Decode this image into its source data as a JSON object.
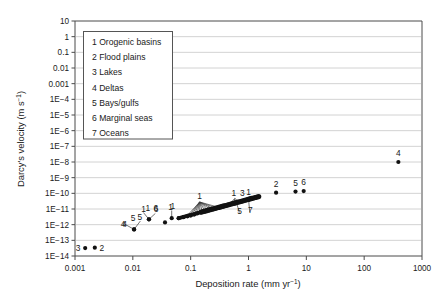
{
  "chart_data": {
    "type": "scatter",
    "title": "",
    "xlabel": "Deposition rate (mm yr^-1)",
    "xlabel_main": "Deposition rate (mm yr",
    "xlabel_sup": "-1",
    "xlabel_tail": ")",
    "ylabel": "Darcy's velocity (m s^-1)",
    "ylabel_main": "Darcy's velocity (m s",
    "ylabel_sup": "-1",
    "ylabel_tail": ")",
    "xscale": "log",
    "yscale": "log",
    "xlim": [
      0.001,
      1000
    ],
    "ylim": [
      1e-14,
      10
    ],
    "grid": "horizontal",
    "legend_position": "upper-left-inside",
    "xticks": [
      "0.001",
      "0.01",
      "0.1",
      "1",
      "10",
      "100",
      "1000"
    ],
    "xtick_values": [
      0.001,
      0.01,
      0.1,
      1,
      10,
      100,
      1000
    ],
    "yticks": [
      "10",
      "1",
      "0.1",
      "0.01",
      "0.001",
      "1E-4",
      "1E-5",
      "1E-6",
      "1E-7",
      "1E-8",
      "1E-9",
      "1E-10",
      "1E-11",
      "1E-12",
      "1E-13",
      "1E-14"
    ],
    "ytick_values": [
      10,
      1,
      0.1,
      0.01,
      0.001,
      0.0001,
      1e-05,
      1e-06,
      1e-07,
      1e-08,
      1e-09,
      1e-10,
      1e-11,
      1e-12,
      1e-13,
      1e-14
    ],
    "legend": [
      {
        "key": "1",
        "label": "1 Orogenic basins"
      },
      {
        "key": "2",
        "label": "2 Flood plains"
      },
      {
        "key": "3",
        "label": "3 Lakes"
      },
      {
        "key": "4",
        "label": "4 Deltas"
      },
      {
        "key": "5",
        "label": "5 Bays/gulfs"
      },
      {
        "key": "6",
        "label": "6 Marginal seas"
      },
      {
        "key": "7",
        "label": "7 Oceans"
      }
    ],
    "points": [
      {
        "x": 0.0015,
        "y": 3.2e-14,
        "label": "3",
        "label_side": "left"
      },
      {
        "x": 0.0022,
        "y": 3.4e-14,
        "label": "2",
        "label_side": "right"
      },
      {
        "x": 0.0105,
        "y": 5e-13,
        "label": "4",
        "label_side": "leader-left"
      },
      {
        "x": 0.0105,
        "y": 5e-13,
        "label": "5",
        "label_side": "leader-up"
      },
      {
        "x": 0.019,
        "y": 2.2e-12,
        "label": "1",
        "label_side": "leader-up"
      },
      {
        "x": 0.019,
        "y": 2.2e-12,
        "label": "6",
        "label_side": "leader-up-right"
      },
      {
        "x": 0.036,
        "y": 1.4e-12,
        "label": null
      },
      {
        "x": 0.047,
        "y": 2.6e-12,
        "label": "1",
        "label_side": "leader-up"
      },
      {
        "x": 0.062,
        "y": 2.6e-12,
        "label": null
      },
      {
        "x": 0.075,
        "y": 3e-12,
        "label": null
      },
      {
        "x": 0.088,
        "y": 3.4e-12,
        "label": null
      },
      {
        "x": 0.1,
        "y": 3.8e-12,
        "label": null
      },
      {
        "x": 0.115,
        "y": 4.4e-12,
        "label": null
      },
      {
        "x": 0.13,
        "y": 5.2e-12,
        "label": null
      },
      {
        "x": 0.15,
        "y": 6e-12,
        "label": null
      },
      {
        "x": 0.17,
        "y": 7e-12,
        "label": null
      },
      {
        "x": 0.2,
        "y": 8.2e-12,
        "label": null
      },
      {
        "x": 0.23,
        "y": 9.6e-12,
        "label": null
      },
      {
        "x": 0.27,
        "y": 1.1e-11,
        "label": null
      },
      {
        "x": 0.32,
        "y": 1.3e-11,
        "label": null
      },
      {
        "x": 0.38,
        "y": 1.5e-11,
        "label": null
      },
      {
        "x": 0.45,
        "y": 1.8e-11,
        "label": null
      },
      {
        "x": 0.55,
        "y": 2.2e-11,
        "label": null
      },
      {
        "x": 0.68,
        "y": 2.8e-11,
        "label": null
      },
      {
        "x": 0.85,
        "y": 3.6e-11,
        "label": null
      },
      {
        "x": 1.05,
        "y": 4.6e-11,
        "label": null
      },
      {
        "x": 1.35,
        "y": 5.8e-11,
        "label": null
      },
      {
        "x": 3.0,
        "y": 1.1e-10,
        "label": "2",
        "label_side": "above"
      },
      {
        "x": 6.5,
        "y": 1.3e-10,
        "label": "5",
        "label_side": "above"
      },
      {
        "x": 9.0,
        "y": 1.4e-10,
        "label": "6",
        "label_side": "above"
      },
      {
        "x": 390,
        "y": 1e-08,
        "label": "4",
        "label_side": "above"
      }
    ],
    "cluster_labels": [
      {
        "label": "1",
        "x_rel": 0.143,
        "y_rel": 1e-11,
        "note": "fan of leaders to mid cluster"
      },
      {
        "label": "1",
        "x_rel": 0.58,
        "y_rel": 5.5e-11,
        "note": "right cluster"
      },
      {
        "label": "3",
        "x_rel": 0.75,
        "y_rel": 6e-11,
        "note": "right cluster"
      },
      {
        "label": "1",
        "x_rel": 0.95,
        "y_rel": 6.2e-11,
        "note": "right cluster"
      },
      {
        "label": "5",
        "x_rel": 0.7,
        "y_rel": 1.3e-11,
        "note": "below right cluster"
      },
      {
        "label": "7",
        "x_rel": 1.05,
        "y_rel": 1.4e-11,
        "note": "below right cluster"
      }
    ]
  }
}
